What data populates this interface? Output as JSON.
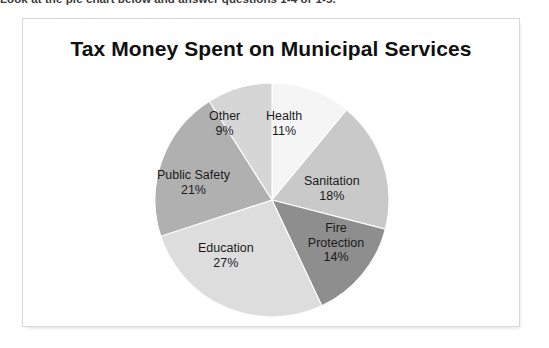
{
  "worksheet": {
    "instruction": "Look at the pie chart below and answer questions 1-4 or 1-5."
  },
  "chart_frame": {
    "border_color": "#d8d8dc",
    "background": "#ffffff"
  },
  "chart_data": {
    "type": "pie",
    "title": "Tax Money Spent on Municipal Services",
    "subtitle": "",
    "xlabel": "",
    "ylabel": "",
    "legend_position": "none",
    "grid": false,
    "labels_inside_slices": true,
    "start_angle_deg": 0,
    "direction": "clockwise",
    "categories": [
      "Health",
      "Sanitation",
      "Fire Protection",
      "Education",
      "Public Safety",
      "Other"
    ],
    "values": [
      11,
      18,
      14,
      27,
      21,
      9
    ],
    "value_suffix": "%",
    "colors": [
      "#f5f5f5",
      "#c9c9c9",
      "#8e8e8e",
      "#dddddd",
      "#b0b0b0",
      "#d6d6d6"
    ],
    "slices": [
      {
        "name": "Health",
        "value": 11,
        "value_label": "11%",
        "color": "#f5f5f5",
        "label_x": 112,
        "label_y": 31,
        "wrap": false
      },
      {
        "name": "Sanitation",
        "value": 18,
        "value_label": "18%",
        "color": "#c9c9c9",
        "label_x": 150,
        "label_y": 96,
        "wrap": false
      },
      {
        "name": "Fire Protection",
        "value": 14,
        "value_label": "14%",
        "color": "#8e8e8e",
        "label_x": 146,
        "label_y": 143,
        "wrap": true
      },
      {
        "name": "Education",
        "value": 27,
        "value_label": "27%",
        "color": "#dddddd",
        "label_x": 44,
        "label_y": 163,
        "wrap": false
      },
      {
        "name": "Public Safety",
        "value": 21,
        "value_label": "21%",
        "color": "#b0b0b0",
        "label_x": 3,
        "label_y": 90,
        "wrap": false
      },
      {
        "name": "Other",
        "value": 9,
        "value_label": "9%",
        "color": "#d6d6d6",
        "label_x": 55,
        "label_y": 31,
        "wrap": false
      }
    ]
  }
}
